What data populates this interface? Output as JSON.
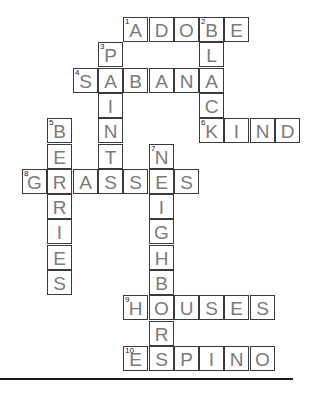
{
  "puzzle": {
    "cell_size": 25.3,
    "origin_x": 22,
    "origin_y": 17,
    "colors": {
      "letter": "#7a7a7a",
      "border": "#3a3a3a",
      "number": "#222222"
    },
    "words": [
      {
        "number": "1",
        "answer": "ADOBE",
        "direction": "across",
        "row": 0,
        "col": 4
      },
      {
        "number": "2",
        "answer": "BLACK",
        "direction": "down",
        "row": 0,
        "col": 7
      },
      {
        "number": "3",
        "answer": "PAINT",
        "direction": "down",
        "row": 1,
        "col": 3
      },
      {
        "number": "4",
        "answer": "SABANA",
        "direction": "across",
        "row": 2,
        "col": 2
      },
      {
        "number": "5",
        "answer": "BERRIES",
        "direction": "down",
        "row": 4,
        "col": 1
      },
      {
        "number": "6",
        "answer": "KIND",
        "direction": "across",
        "row": 4,
        "col": 7
      },
      {
        "number": "7",
        "answer": "NEIGHBORS",
        "direction": "down",
        "row": 5,
        "col": 5
      },
      {
        "number": "8",
        "answer": "GRASSES",
        "direction": "across",
        "row": 6,
        "col": 0
      },
      {
        "number": "9",
        "answer": "HOUSES",
        "direction": "across",
        "row": 11,
        "col": 4
      },
      {
        "number": "10",
        "answer": "ESPINO",
        "direction": "across",
        "row": 13,
        "col": 4
      }
    ]
  }
}
